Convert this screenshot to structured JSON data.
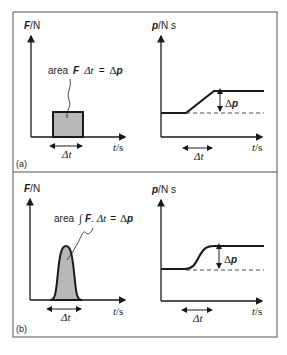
{
  "figure": {
    "panels": [
      {
        "tag": "(a)",
        "force_plot": {
          "y_label_symbol": "F",
          "y_label_unit": "/N",
          "x_label_symbol": "t",
          "x_label_unit": "/s",
          "annotation": "area  F  Δt  =  Δp",
          "annotation_parts": {
            "prefix": "area",
            "f": "F",
            "dt": "Δt",
            "eq": "=",
            "dp_delta": "Δ",
            "dp_p": "p"
          },
          "interval_label": "Δt",
          "shape": "rectangle"
        },
        "momentum_plot": {
          "y_label_symbol": "p",
          "y_label_unit": "/N s",
          "x_label_symbol": "t",
          "x_label_unit": "/s",
          "step_label_delta": "Δ",
          "step_label_p": "p",
          "interval_label": "Δt",
          "shape": "linear ramp"
        }
      },
      {
        "tag": "(b)",
        "force_plot": {
          "y_label_symbol": "F",
          "y_label_unit": "/N",
          "x_label_symbol": "t",
          "x_label_unit": "/s",
          "annotation_parts": {
            "prefix": "area",
            "integral": "∫",
            "f": "F",
            "dot_dt": ". Δt",
            "eq": "=",
            "dp_delta": "Δ",
            "dp_p": "p"
          },
          "interval_label": "Δt",
          "shape": "smooth pulse"
        },
        "momentum_plot": {
          "y_label_symbol": "p",
          "y_label_unit": "/N s",
          "x_label_symbol": "t",
          "x_label_unit": "/s",
          "step_label_delta": "Δ",
          "step_label_p": "p",
          "interval_label": "Δt",
          "shape": "smooth S-curve"
        }
      }
    ],
    "colors": {
      "line": "#1a1a1a",
      "fill": "#b8b8b8",
      "frame": "#555555"
    }
  }
}
